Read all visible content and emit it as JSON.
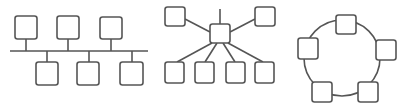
{
  "diagram": {
    "colors": {
      "stroke": "#555555",
      "fill": "#ffffff",
      "background": "#ffffff"
    },
    "topologies": [
      {
        "name": "bus",
        "backbone": {
          "x1": 10,
          "y1": 51,
          "x2": 148,
          "y2": 51
        },
        "nodes": [
          {
            "x": 15,
            "y": 16,
            "w": 22,
            "h": 23,
            "stub": {
              "x": 26,
              "y1": 39,
              "y2": 51
            }
          },
          {
            "x": 57,
            "y": 16,
            "w": 22,
            "h": 23,
            "stub": {
              "x": 68,
              "y1": 39,
              "y2": 51
            }
          },
          {
            "x": 100,
            "y": 17,
            "w": 22,
            "h": 22,
            "stub": {
              "x": 111,
              "y1": 39,
              "y2": 51
            }
          },
          {
            "x": 36,
            "y": 62,
            "w": 22,
            "h": 23,
            "stub": {
              "x": 47,
              "y1": 51,
              "y2": 62
            }
          },
          {
            "x": 77,
            "y": 62,
            "w": 22,
            "h": 23,
            "stub": {
              "x": 89,
              "y1": 51,
              "y2": 62
            }
          },
          {
            "x": 120,
            "y": 62,
            "w": 23,
            "h": 23,
            "stub": {
              "x": 132,
              "y1": 51,
              "y2": 62
            }
          }
        ]
      },
      {
        "name": "star",
        "hub": {
          "x": 210,
          "y": 24,
          "w": 20,
          "h": 19
        },
        "hub_stub": {
          "x": 220,
          "y1": 9,
          "y2": 24
        },
        "nodes": [
          {
            "x": 165,
            "y": 7,
            "w": 20,
            "h": 19,
            "link": {
              "x1": 185,
              "y1": 19,
              "x2": 210,
              "y2": 32
            }
          },
          {
            "x": 255,
            "y": 7,
            "w": 20,
            "h": 19,
            "link": {
              "x1": 255,
              "y1": 19,
              "x2": 230,
              "y2": 32
            }
          },
          {
            "x": 165,
            "y": 62,
            "w": 19,
            "h": 21,
            "link": {
              "x1": 177,
              "y1": 62,
              "x2": 212,
              "y2": 43
            }
          },
          {
            "x": 195,
            "y": 62,
            "w": 19,
            "h": 21,
            "link": {
              "x1": 205,
              "y1": 62,
              "x2": 217,
              "y2": 43
            }
          },
          {
            "x": 226,
            "y": 62,
            "w": 19,
            "h": 21,
            "link": {
              "x1": 235,
              "y1": 62,
              "x2": 223,
              "y2": 43
            }
          },
          {
            "x": 255,
            "y": 62,
            "w": 19,
            "h": 21,
            "link": {
              "x1": 263,
              "y1": 62,
              "x2": 228,
              "y2": 43
            }
          }
        ]
      },
      {
        "name": "ring",
        "ring": {
          "cx": 342,
          "cy": 58,
          "r": 38
        },
        "nodes": [
          {
            "x": 336,
            "y": 15,
            "w": 20,
            "h": 19
          },
          {
            "x": 376,
            "y": 40,
            "w": 20,
            "h": 20
          },
          {
            "x": 298,
            "y": 38,
            "w": 20,
            "h": 21
          },
          {
            "x": 312,
            "y": 82,
            "w": 20,
            "h": 20
          },
          {
            "x": 358,
            "y": 82,
            "w": 20,
            "h": 20
          }
        ]
      }
    ]
  }
}
